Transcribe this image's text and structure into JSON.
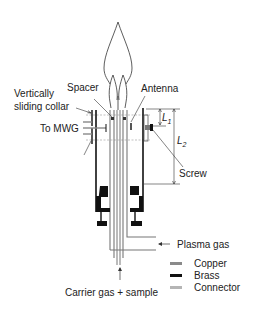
{
  "diagram": {
    "labels": {
      "vertically_sliding_collar_1": "Vertically",
      "vertically_sliding_collar_2": "sliding collar",
      "spacer": "Spacer",
      "antenna": "Antenna",
      "to_mwg": "To MWG",
      "l1": "L",
      "l1_sub": "1",
      "l2": "L",
      "l2_sub": "2",
      "screw": "Screw",
      "plasma_gas": "Plasma gas",
      "carrier_gas": "Carrier gas + sample"
    },
    "legend": [
      {
        "label": "Copper",
        "color": "#8a8a8a",
        "swatch": "copper-swatch"
      },
      {
        "label": "Brass",
        "color": "#111111",
        "swatch": "brass-swatch"
      },
      {
        "label": "Connector",
        "color": "#b5b5b5",
        "swatch": "connector-swatch"
      }
    ],
    "colors": {
      "line": "#222222",
      "copper": "#8a8a8a",
      "brass": "#111111",
      "connector": "#b5b5b5"
    }
  }
}
